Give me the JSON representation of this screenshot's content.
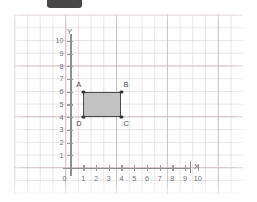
{
  "redaction": {
    "name": "redaction-bar",
    "color": "#474747"
  },
  "canvas": {
    "background": "#ffffff",
    "grid_minor_color": "#cdbabe",
    "grid_major_color": "#b6a2a8"
  },
  "chart_data": {
    "type": "scatter",
    "title": "",
    "xlabel": "X",
    "ylabel": "Y",
    "xlim": [
      0,
      11
    ],
    "ylim": [
      0,
      10.8
    ],
    "grid": true,
    "legend": false,
    "x_ticks": [
      "0",
      "1",
      "2",
      "3",
      "4",
      "5",
      "6",
      "7",
      "8",
      "9",
      "10"
    ],
    "x_tick_values": [
      0,
      1,
      2,
      3,
      4,
      5,
      6,
      7,
      8,
      9,
      10
    ],
    "y_ticks": [
      "1",
      "2",
      "3",
      "4",
      "5",
      "6",
      "7",
      "8",
      "9",
      "10"
    ],
    "y_tick_values": [
      1,
      2,
      3,
      4,
      5,
      6,
      7,
      8,
      9,
      10
    ],
    "origin_label": "0",
    "shapes": [
      {
        "name": "rectangle-abcd",
        "kind": "rectangle",
        "fill": "#c2c2c2",
        "stroke": "#4a4a4a",
        "vertices": [
          {
            "label": "A",
            "x": 1,
            "y": 6,
            "label_pos": "top-left"
          },
          {
            "label": "B",
            "x": 4,
            "y": 6,
            "label_pos": "top-right"
          },
          {
            "label": "C",
            "x": 4,
            "y": 4,
            "label_pos": "bottom-right"
          },
          {
            "label": "D",
            "x": 1,
            "y": 4,
            "label_pos": "bottom-left"
          }
        ],
        "width_units": 3,
        "height_units": 2
      }
    ]
  }
}
